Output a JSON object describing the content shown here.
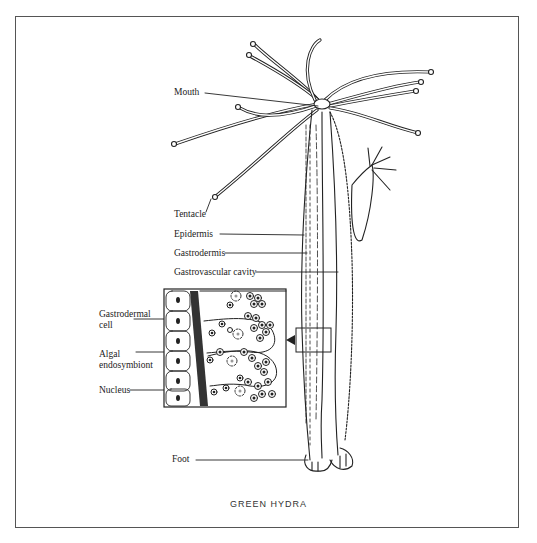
{
  "figure": {
    "title": "GREEN HYDRA",
    "labels": {
      "mouth": "Mouth",
      "tentacle": "Tentacle",
      "epidermis": "Epidermis",
      "gastrodermis": "Gastrodermis",
      "gastrovascular_cavity": "Gastrovascular cavity",
      "gastrodermal_cell_line1": "Gastrodermal",
      "gastrodermal_cell_line2": "cell",
      "algal_endosymbiont_line1": "Algal",
      "algal_endosymbiont_line2": "endosymbiont",
      "nucleus": "Nucleus",
      "foot": "Foot"
    },
    "colors": {
      "ink": "#222222",
      "frame": "#555555",
      "background": "#ffffff"
    }
  }
}
